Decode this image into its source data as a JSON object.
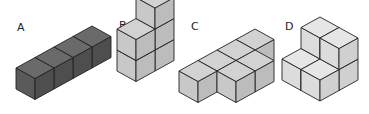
{
  "figure": {
    "iso": {
      "ax": 19,
      "ay": -10.5,
      "bx": 19,
      "by": 10.5,
      "h": 21
    },
    "options": [
      {
        "label": "A",
        "label_pos": [
          17,
          31
        ],
        "base": [
          16,
          89
        ],
        "colors": {
          "top": "#6a6a6a",
          "left": "#5a5a5a",
          "right": "#4e4e4e"
        },
        "cubes": [
          [
            0,
            0,
            0
          ],
          [
            1,
            0,
            0
          ],
          [
            2,
            0,
            0
          ],
          [
            3,
            0,
            0
          ]
        ]
      },
      {
        "label": "B",
        "label_pos": [
          119,
          29
        ],
        "base": [
          117,
          71
        ],
        "colors": {
          "top": "#d2d2d2",
          "left": "#c8c8c8",
          "right": "#bcbcbc"
        },
        "cubes": [
          [
            0,
            0,
            0
          ],
          [
            1,
            0,
            0
          ],
          [
            0,
            0,
            1
          ],
          [
            1,
            0,
            1
          ],
          [
            1,
            0,
            2
          ]
        ]
      },
      {
        "label": "C",
        "label_pos": [
          191,
          30
        ],
        "base": [
          179,
          92
        ],
        "colors": {
          "top": "#d2d2d2",
          "left": "#c8c8c8",
          "right": "#bcbcbc"
        },
        "cubes": [
          [
            3,
            0,
            0
          ],
          [
            2,
            0,
            0
          ],
          [
            1,
            0,
            0
          ],
          [
            0,
            0,
            0
          ],
          [
            2,
            1,
            0
          ],
          [
            1,
            1,
            0
          ]
        ]
      },
      {
        "label": "D",
        "label_pos": [
          285,
          30
        ],
        "base": [
          282,
          80
        ],
        "colors": {
          "top": "#e6e6e6",
          "left": "#dcdcdc",
          "right": "#d0d0d0"
        },
        "cubes": [
          [
            1,
            0,
            0
          ],
          [
            1,
            1,
            0
          ],
          [
            0,
            0,
            0
          ],
          [
            0,
            1,
            0
          ],
          [
            1,
            0,
            1
          ],
          [
            1,
            1,
            1
          ]
        ]
      }
    ]
  }
}
